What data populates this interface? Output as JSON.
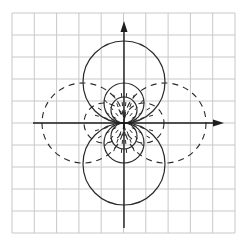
{
  "diagram": {
    "title": "",
    "colors": {
      "background": "#ffffff",
      "grid": "#c8c8c8",
      "lines": "#2a2a2a"
    },
    "grid": {
      "x0": 12,
      "y0": 13,
      "x1": 235,
      "y1": 233,
      "cells_x": 10,
      "cells_y": 10
    },
    "origin": {
      "x": 124,
      "y": 123
    },
    "axes": {
      "x_axis": {
        "from": 33,
        "to": 224,
        "arrow": "right"
      },
      "y_axis": {
        "from": 228,
        "to": 21,
        "arrow": "up"
      }
    },
    "solid_circles": [
      {
        "cx": 124,
        "cy": 82,
        "r": 41
      },
      {
        "cx": 124,
        "cy": 164,
        "r": 41
      },
      {
        "cx": 124,
        "cy": 103,
        "r": 20
      },
      {
        "cx": 124,
        "cy": 143,
        "r": 20
      },
      {
        "cx": 124,
        "cy": 110,
        "r": 13
      },
      {
        "cx": 124,
        "cy": 136,
        "r": 13
      }
    ],
    "dashed_circles": [
      {
        "cx": 83,
        "cy": 123,
        "rx": 41,
        "ry": 40
      },
      {
        "cx": 165,
        "cy": 123,
        "rx": 41,
        "ry": 40
      },
      {
        "cx": 104,
        "cy": 123,
        "rx": 20,
        "ry": 20
      },
      {
        "cx": 144,
        "cy": 123,
        "rx": 20,
        "ry": 20
      }
    ],
    "labels": []
  }
}
